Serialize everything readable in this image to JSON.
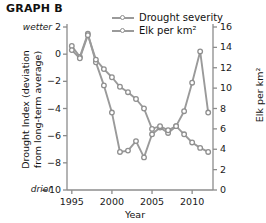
{
  "title": "GRAPH B",
  "legend": [
    {
      "label": "Drought severity",
      "key": "legend-key-drought"
    },
    {
      "label": "Elk per km²",
      "key": "legend-key-elk"
    }
  ],
  "axes": {
    "x": {
      "title": "Year",
      "ticks": [
        "1995",
        "2000",
        "2005",
        "2010"
      ],
      "tickvals": [
        1995,
        2000,
        2005,
        2010
      ],
      "range": [
        1994.4,
        2012.6
      ]
    },
    "y_left": {
      "title_line1": "Drought Index (deviation",
      "title_line2": "from long-term average)",
      "ticks": [
        "2",
        "0",
        "−2",
        "−4",
        "−6",
        "−8",
        "−10"
      ],
      "tickvals": [
        2,
        0,
        -2,
        -4,
        -6,
        -8,
        -10
      ],
      "range": [
        -10,
        2
      ],
      "top_note": "wetter",
      "bottom_note": "drier"
    },
    "y_right": {
      "title": "Elk per km²",
      "ticks": [
        "16",
        "14",
        "12",
        "10",
        "8",
        "6",
        "4",
        "2",
        "0"
      ],
      "tickvals": [
        16,
        14,
        12,
        10,
        8,
        6,
        4,
        2,
        0
      ],
      "range": [
        0,
        16
      ]
    }
  },
  "colors": {
    "line": "#9a9a9a",
    "marker_edge": "#8f8f8f",
    "marker_fill": "#ffffff",
    "axis": "#8c8c8c",
    "text": "#111111"
  },
  "chart_data": {
    "type": "line",
    "title": "GRAPH B",
    "xlabel": "Year",
    "ylabel": "Drought Index (deviation from long-term average)",
    "y2label": "Elk per km²",
    "ylim": [
      -10,
      2
    ],
    "y2lim": [
      0,
      16
    ],
    "xlim": [
      1994.4,
      2012.6
    ],
    "grid": false,
    "legend_position": "top-center",
    "x": [
      1995,
      1996,
      1997,
      1998,
      1999,
      2000,
      2001,
      2002,
      2003,
      2004,
      2005,
      2006,
      2007,
      2008,
      2009,
      2010,
      2011,
      2012
    ],
    "series": [
      {
        "name": "Drought severity",
        "axis": "left",
        "units": "drought index (deviation from long-term average)",
        "values": [
          0.6,
          -0.2,
          1.5,
          -0.6,
          -2.3,
          -4.3,
          -7.2,
          -7.1,
          -6.4,
          -7.6,
          -5.9,
          -5.4,
          -5.8,
          -5.3,
          -4.2,
          -2.1,
          0.2,
          -4.3
        ]
      },
      {
        "name": "Elk per km²",
        "axis": "right",
        "units": "elk per km²",
        "values_index_scale": [
          0.3,
          -0.3,
          1.4,
          -0.4,
          -1.1,
          -1.7,
          -2.4,
          -2.8,
          -3.3,
          -4.0,
          -5.5,
          -5.3,
          -5.6,
          -5.3,
          -5.9,
          -6.5,
          -6.9,
          -7.2
        ],
        "values": [
          13.7,
          12.9,
          14.9,
          12.8,
          11.9,
          11.1,
          10.1,
          9.6,
          8.9,
          8.0,
          6.0,
          6.3,
          5.9,
          6.3,
          5.5,
          4.7,
          4.1,
          3.7
        ]
      }
    ]
  }
}
